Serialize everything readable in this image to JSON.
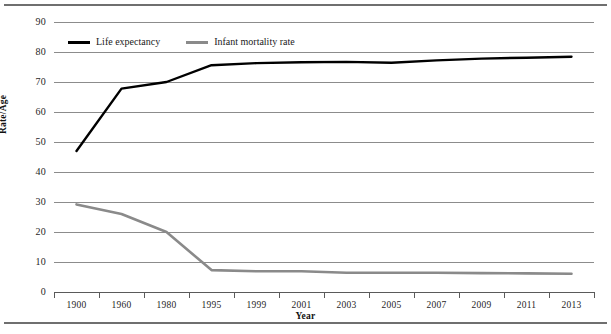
{
  "chart_data": {
    "type": "line",
    "title": "",
    "xlabel": "Year",
    "ylabel": "Rate/Age",
    "categories": [
      "1900",
      "1960",
      "1980",
      "1995",
      "1999",
      "2001",
      "2003",
      "2005",
      "2007",
      "2009",
      "2011",
      "2013"
    ],
    "yticks": [
      0,
      10,
      20,
      30,
      40,
      50,
      60,
      70,
      80,
      90
    ],
    "ylim": [
      0,
      90
    ],
    "grid": true,
    "legend_position": "top-left inside plot",
    "series": [
      {
        "name": "Life expectancy",
        "color": "#000000",
        "values": [
          47.0,
          67.8,
          70.0,
          75.6,
          76.3,
          76.6,
          76.7,
          76.4,
          77.2,
          77.8,
          78.1,
          78.4
        ]
      },
      {
        "name": "Infant mortality rate",
        "color": "#8a8a8a",
        "values": [
          29.2,
          26.0,
          20.0,
          7.3,
          6.9,
          6.9,
          6.4,
          6.4,
          6.4,
          6.3,
          6.2,
          6.1
        ]
      }
    ]
  },
  "legend": {
    "items": [
      {
        "label": "Life expectancy",
        "color": "#000000"
      },
      {
        "label": "Infant mortality rate",
        "color": "#8a8a8a"
      }
    ]
  },
  "axes": {
    "y_title": "Rate/Age",
    "x_title": "Year"
  }
}
